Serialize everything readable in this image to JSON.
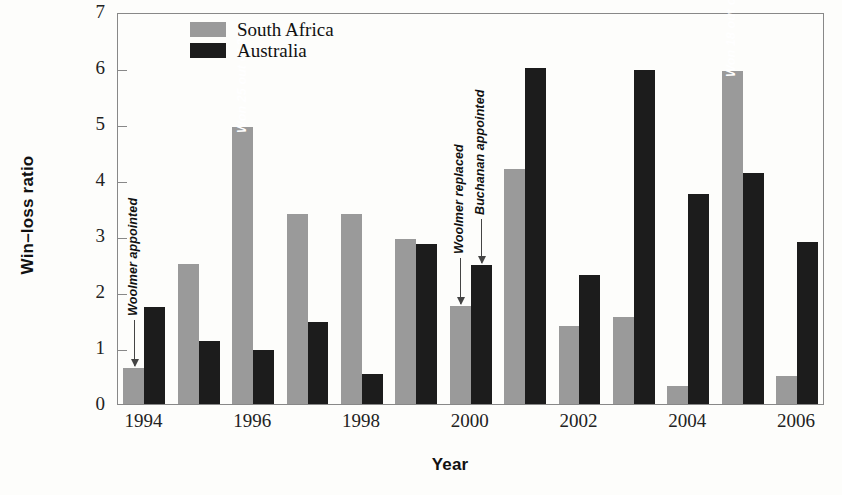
{
  "chart_data": {
    "type": "bar",
    "title": "",
    "xlabel": "Year",
    "ylabel": "Win–loss ratio",
    "ylim": [
      0,
      7
    ],
    "yticks": [
      0,
      1,
      2,
      3,
      4,
      5,
      6,
      7
    ],
    "ytick_labels": [
      "0",
      "1",
      "2",
      "3",
      "4",
      "5",
      "6",
      "7"
    ],
    "grid": false,
    "legend_position": "top-left inside",
    "categories": [
      1994,
      1995,
      1996,
      1997,
      1998,
      1999,
      2000,
      2001,
      2002,
      2003,
      2004,
      2005,
      2006
    ],
    "xtick_labels": [
      "1994",
      "1996",
      "1998",
      "2000",
      "2002",
      "2004",
      "2006"
    ],
    "xticks": [
      1994,
      1996,
      1998,
      2000,
      2002,
      2004,
      2006
    ],
    "series": [
      {
        "name": "South Africa",
        "color": "#9a9a9a",
        "values": [
          0.65,
          2.5,
          4.95,
          3.4,
          3.4,
          2.95,
          1.75,
          4.2,
          1.4,
          1.55,
          0.33,
          5.95,
          0.5
        ]
      },
      {
        "name": "Australia",
        "color": "#1c1c1c",
        "values": [
          1.73,
          1.13,
          0.97,
          1.47,
          0.53,
          2.85,
          2.48,
          6.0,
          2.3,
          5.97,
          3.75,
          4.13,
          2.9
        ]
      }
    ],
    "annotations": [
      {
        "id": "woolmer-appointed",
        "text": "Woolmer appointed",
        "style": "outside-arrow",
        "target_year": 1994,
        "target_series": "South Africa"
      },
      {
        "id": "won-25-of-30",
        "text": "Won 25 out of 30",
        "style": "inside-bar",
        "target_year": 1996,
        "target_series": "South Africa"
      },
      {
        "id": "woolmer-replaced",
        "text": "Woolmer replaced",
        "style": "outside-arrow",
        "target_year": 2000,
        "target_series": "South Africa"
      },
      {
        "id": "buchanan-appointed",
        "text": "Buchanan appointed",
        "style": "outside-arrow",
        "target_year": 2000,
        "target_series": "Australia"
      },
      {
        "id": "won-18-of-24",
        "text": "Won 18 out of 24, 13 in a row (Zim,WI, NZ)",
        "style": "inside-bar",
        "target_year": 2005,
        "target_series": "South Africa"
      }
    ]
  },
  "legend": {
    "items": [
      {
        "label": "South Africa",
        "color": "#9a9a9a"
      },
      {
        "label": "Australia",
        "color": "#1c1c1c"
      }
    ]
  }
}
